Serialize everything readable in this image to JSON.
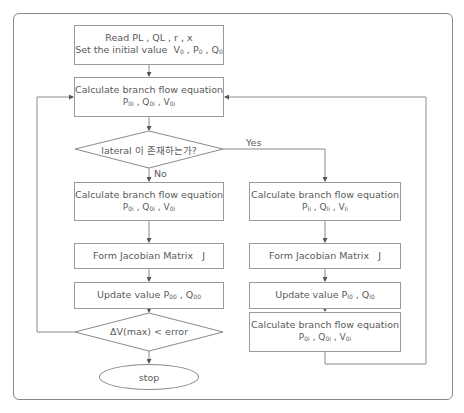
{
  "flowchart": {
    "start_box": {
      "line1": "Read  PL , QL , r , x",
      "line2": "Set the initial value  V",
      "vars": [
        "V0",
        "P0",
        "Q0"
      ]
    },
    "calc_main": {
      "title": "Calculate branch flow equation",
      "vars": [
        {
          "base": "P",
          "sub": "0i"
        },
        {
          "base": "Q",
          "sub": "0i"
        },
        {
          "base": "V",
          "sub": "0i"
        }
      ]
    },
    "decision_lateral": {
      "text": "lateral 이 존재하는가?",
      "yes_label": "Yes",
      "no_label": "No"
    },
    "left_branch": {
      "calc": {
        "title": "Calculate branch flow equation",
        "vars": [
          {
            "base": "P",
            "sub": "0i"
          },
          {
            "base": "Q",
            "sub": "0i"
          },
          {
            "base": "V",
            "sub": "0i"
          }
        ]
      },
      "jacobian": "Form Jacobian Matrix   J",
      "update": {
        "prefix": "Update value ",
        "vars": [
          {
            "base": "P",
            "sub": "00"
          },
          {
            "base": "Q",
            "sub": "00"
          }
        ]
      }
    },
    "right_branch": {
      "calc": {
        "title": "Calculate branch flow equation",
        "vars": [
          {
            "base": "P",
            "sub": "li"
          },
          {
            "base": "Q",
            "sub": "li"
          },
          {
            "base": "V",
            "sub": "li"
          }
        ]
      },
      "jacobian": "Form Jacobian Matrix   J",
      "update": {
        "prefix": "Update value ",
        "vars": [
          {
            "base": "P",
            "sub": "l0"
          },
          {
            "base": "Q",
            "sub": "l0"
          }
        ]
      },
      "calc2": {
        "title": "Calculate branch flow equation",
        "vars": [
          {
            "base": "P",
            "sub": "0i"
          },
          {
            "base": "Q",
            "sub": "0i"
          },
          {
            "base": "V",
            "sub": "0i"
          }
        ]
      }
    },
    "decision_error": {
      "text": "ΔV(max) < error"
    },
    "end": {
      "text": "stop"
    }
  }
}
